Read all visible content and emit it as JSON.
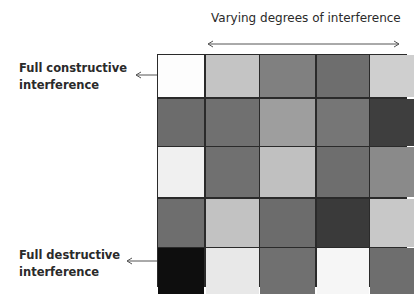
{
  "top_label": "Varying degrees of interference",
  "labels": {
    "constructive_line1": "Full constructive",
    "constructive_line2": "interference",
    "destructive_line1": "Full destructive",
    "destructive_line2": "interference"
  },
  "grid": {
    "rows": 5,
    "cols": 5,
    "colors": [
      [
        "#fdfdfd",
        "#c4c4c4",
        "#808080",
        "#6e6e6e",
        "#cfcfcf"
      ],
      [
        "#6c6c6c",
        "#707070",
        "#9e9e9e",
        "#767676",
        "#3e3e3e"
      ],
      [
        "#f0f0f0",
        "#707070",
        "#c0c0c0",
        "#6e6e6e",
        "#8a8a8a"
      ],
      [
        "#6e6e6e",
        "#c2c2c2",
        "#6c6c6c",
        "#3a3a3a",
        "#c8c8c8"
      ],
      [
        "#0e0e0e",
        "#e8e8e8",
        "#707070",
        "#f6f6f6",
        "#6e6e6e"
      ]
    ]
  }
}
